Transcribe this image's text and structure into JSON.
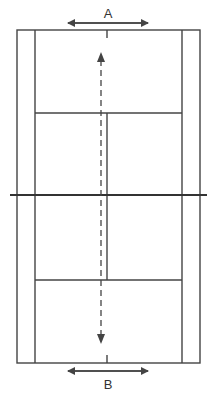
{
  "diagram": {
    "type": "badminton-court-plan",
    "label_top": "A",
    "label_bottom": "B",
    "caption_partial": "…",
    "colors": {
      "line": "#444444",
      "net": "#333333",
      "background": "#ffffff"
    }
  }
}
